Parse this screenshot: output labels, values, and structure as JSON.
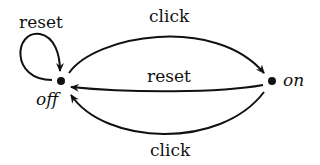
{
  "diagram": {
    "type": "state-machine",
    "states": [
      {
        "id": "off",
        "label": "off"
      },
      {
        "id": "on",
        "label": "on"
      }
    ],
    "transitions": [
      {
        "from": "off",
        "to": "off",
        "label": "reset"
      },
      {
        "from": "off",
        "to": "on",
        "label": "click"
      },
      {
        "from": "on",
        "to": "off",
        "label": "reset"
      },
      {
        "from": "on",
        "to": "off",
        "label": "click"
      }
    ]
  }
}
